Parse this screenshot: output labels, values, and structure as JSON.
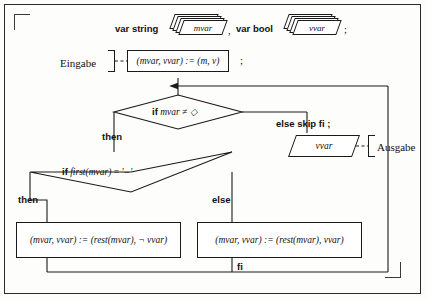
{
  "diagram": {
    "declaration": {
      "var_string_keyword": "var string",
      "mvar_name": "mvar",
      "comma": ",",
      "var_bool_keyword": "var bool",
      "vvar_name": "vvar",
      "semicolon": ";"
    },
    "input": {
      "label": "Eingabe",
      "statement": "(mvar, vvar) := (m, v)",
      "semicolon": ";"
    },
    "outer_decision": {
      "condition": "if mvar ≠ ◇",
      "then_label": "then",
      "else_label": "else skip fi ;"
    },
    "output": {
      "value": "vvar",
      "label": "Ausgabe"
    },
    "inner_decision": {
      "condition_prefix": "if",
      "condition_func": "first(mvar)",
      "condition_eq": "=",
      "condition_literal": "'–'",
      "then_label": "then",
      "else_label": "else"
    },
    "then_branch": {
      "statement": "(mvar, vvar) := (rest(mvar), ¬ vvar)"
    },
    "else_branch": {
      "statement": "(mvar, vvar) := (rest(mvar), vvar)"
    },
    "merge": {
      "fi_label": "fi"
    },
    "colors": {
      "ink": "#1a1a1a",
      "paper": "#fdfdfb"
    }
  }
}
